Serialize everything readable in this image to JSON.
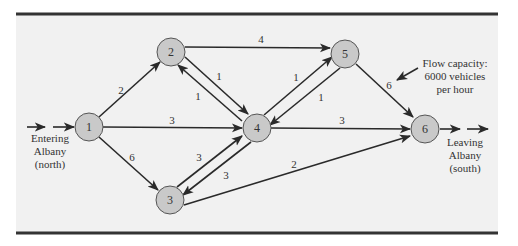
{
  "diagram": {
    "title": "",
    "colors": {
      "background": "#f1f1f1",
      "node_fill": "#c9c9c9",
      "edge": "#2a2a2a",
      "rule": "#333333"
    },
    "nodes": [
      {
        "id": "1",
        "label": "1",
        "x": 89,
        "y": 127
      },
      {
        "id": "2",
        "label": "2",
        "x": 171,
        "y": 52
      },
      {
        "id": "3",
        "label": "3",
        "x": 170,
        "y": 200
      },
      {
        "id": "4",
        "label": "4",
        "x": 257,
        "y": 128
      },
      {
        "id": "5",
        "label": "5",
        "x": 345,
        "y": 54
      },
      {
        "id": "6",
        "label": "6",
        "x": 425,
        "y": 129
      }
    ],
    "edges": [
      {
        "from": "1",
        "to": "2",
        "capacity": "2"
      },
      {
        "from": "1",
        "to": "4",
        "capacity": "3"
      },
      {
        "from": "1",
        "to": "3",
        "capacity": "6"
      },
      {
        "from": "2",
        "to": "5",
        "capacity": "4"
      },
      {
        "from": "2",
        "to": "4",
        "capacity": "1"
      },
      {
        "from": "4",
        "to": "2",
        "capacity": "1"
      },
      {
        "from": "4",
        "to": "5",
        "capacity": "1"
      },
      {
        "from": "5",
        "to": "4",
        "capacity": "1"
      },
      {
        "from": "3",
        "to": "4",
        "capacity": "3"
      },
      {
        "from": "4",
        "to": "3",
        "capacity": "3"
      },
      {
        "from": "4",
        "to": "6",
        "capacity": "3"
      },
      {
        "from": "5",
        "to": "6",
        "capacity": "6"
      },
      {
        "from": "3",
        "to": "6",
        "capacity": "2"
      }
    ],
    "entry": {
      "line1": "Entering",
      "line2": "Albany",
      "line3": "(north)"
    },
    "exit": {
      "line1": "Leaving",
      "line2": "Albany",
      "line3": "(south)"
    },
    "annotation": {
      "line1": "Flow capacity:",
      "line2": "6000 vehicles",
      "line3": "per hour"
    }
  }
}
